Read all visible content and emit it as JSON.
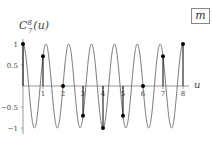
{
  "chart_data": {
    "type": "line",
    "title": "",
    "ylabel": "C_7^8(u)",
    "ylabel_display": {
      "base": "C",
      "sup": "8",
      "sub": "7",
      "arg": "(u)"
    },
    "xlabel": "u",
    "xlim": [
      0,
      8
    ],
    "ylim": [
      -1,
      1
    ],
    "x_ticks": [
      "1",
      "2",
      "3",
      "4",
      "5",
      "6",
      "7",
      "8"
    ],
    "y_ticks": [
      "1",
      "0.5",
      "-0.5",
      "-1"
    ],
    "grid": false,
    "legend": {
      "position": "top-right",
      "entries": [
        "m"
      ]
    },
    "series": [
      {
        "name": "continuous",
        "kind": "line",
        "function": "cos(2*pi*7*u/8)",
        "color": "#777777"
      },
      {
        "name": "samples",
        "kind": "stem",
        "color": "#000000",
        "x": [
          0,
          1,
          2,
          3,
          4,
          5,
          6,
          7,
          8
        ],
        "values": [
          1,
          0.707,
          0,
          -0.707,
          -1,
          -0.707,
          0,
          0.707,
          1
        ]
      }
    ]
  },
  "legend": {
    "label": "m"
  }
}
